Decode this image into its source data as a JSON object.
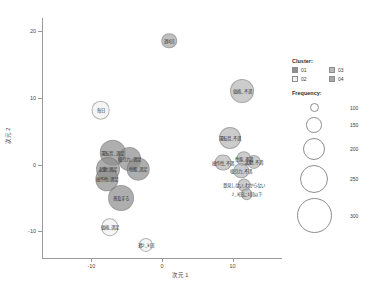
{
  "chart_data": {
    "type": "scatter",
    "title": "",
    "xlabel": "次元 1",
    "ylabel": "次元 2",
    "xlim": [
      -17,
      17
    ],
    "ylim": [
      -14,
      22
    ],
    "xticks": [
      "-10",
      "0",
      "10"
    ],
    "xtick_values": [
      -10,
      0,
      10
    ],
    "yticks": [
      "20",
      "10",
      "0",
      "-10"
    ],
    "ytick_values": [
      20,
      10,
      0,
      -10
    ],
    "grid": false,
    "legend_position": "right",
    "size_encoding": "Frequency",
    "color_encoding": "Cluster",
    "points": [
      {
        "label": "週1回",
        "x": 1.0,
        "y": 18.6,
        "freq": 150,
        "cluster": "04"
      },
      {
        "label": "価格_不満",
        "x": 11.4,
        "y": 11.0,
        "freq": 215,
        "cluster": "03"
      },
      {
        "label": "毎日",
        "x": -8.7,
        "y": 8.2,
        "freq": 175,
        "cluster": "02"
      },
      {
        "label": "運転音_不満",
        "x": 9.6,
        "y": 4.0,
        "freq": 200,
        "cluster": "03"
      },
      {
        "label": "性能_不満",
        "x": 11.6,
        "y": 0.9,
        "freq": 150,
        "cluster": "03"
      },
      {
        "label": "起動_不満",
        "x": 13.0,
        "y": 0.4,
        "freq": 140,
        "cluster": "03"
      },
      {
        "label": "操作性_不満",
        "x": 8.6,
        "y": 0.3,
        "freq": 160,
        "cluster": "03"
      },
      {
        "label": "吸引力_不満",
        "x": 11.2,
        "y": -0.9,
        "freq": 150,
        "cluster": "03"
      },
      {
        "label": "意見しない_わからない",
        "x": 11.6,
        "y": -3.0,
        "freq": 130,
        "cluster": "03"
      },
      {
        "label": "2_3回に1回以下",
        "x": 12.0,
        "y": -4.4,
        "freq": 120,
        "cluster": "03"
      },
      {
        "label": "運転音_満足",
        "x": -7.0,
        "y": 1.8,
        "freq": 235,
        "cluster": "01"
      },
      {
        "label": "吸引力_満足",
        "x": -4.6,
        "y": 0.9,
        "freq": 215,
        "cluster": "01"
      },
      {
        "label": "起動_満足",
        "x": -7.6,
        "y": -0.6,
        "freq": 215,
        "cluster": "01"
      },
      {
        "label": "性能_満足",
        "x": -3.4,
        "y": -0.7,
        "freq": 205,
        "cluster": "01"
      },
      {
        "label": "操作性_満足",
        "x": -7.8,
        "y": -2.2,
        "freq": 210,
        "cluster": "01"
      },
      {
        "label": "普及する",
        "x": -5.8,
        "y": -5.0,
        "freq": 230,
        "cluster": "01"
      },
      {
        "label": "価格_満足",
        "x": -7.4,
        "y": -9.4,
        "freq": 165,
        "cluster": "02"
      },
      {
        "label": "週2_3回",
        "x": -2.3,
        "y": -12.0,
        "freq": 140,
        "cluster": "02"
      }
    ],
    "cluster_colors": {
      "01": "#8f8f8f",
      "02": "#f2f2f2",
      "03": "#b9b9b9",
      "04": "#a8a8a8"
    }
  },
  "legend": {
    "cluster_title": "Cluster:",
    "cluster_items": [
      {
        "id": "01",
        "label": "01"
      },
      {
        "id": "03",
        "label": "03"
      },
      {
        "id": "02",
        "label": "02"
      },
      {
        "id": "04",
        "label": "04"
      }
    ],
    "frequency_title": "Frequency:",
    "frequency_items": [
      {
        "label": "100",
        "value": 100
      },
      {
        "label": "150",
        "value": 150
      },
      {
        "label": "200",
        "value": 200
      },
      {
        "label": "250",
        "value": 250
      },
      {
        "label": "300",
        "value": 300
      }
    ]
  }
}
